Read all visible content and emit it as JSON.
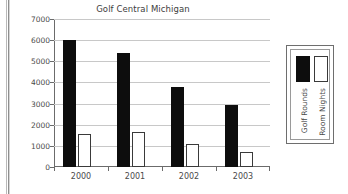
{
  "chart_data": {
    "type": "bar",
    "title": "Golf Central Michigan",
    "xlabel": "",
    "ylabel": "",
    "categories": [
      "2000",
      "2001",
      "2002",
      "2003"
    ],
    "series": [
      {
        "name": "Golf Rounds",
        "values": [
          6000,
          5400,
          3780,
          2930
        ],
        "color": "#0d0d0d",
        "fill": "solid-black"
      },
      {
        "name": "Room Nights",
        "values": [
          1550,
          1640,
          1100,
          730
        ],
        "color": "#ffffff",
        "fill": "white-outlined"
      }
    ],
    "ylim": [
      0,
      7000
    ],
    "yticks": [
      0,
      1000,
      2000,
      3000,
      4000,
      5000,
      6000,
      7000
    ],
    "ytick_labels": [
      "0",
      "1000",
      "2000",
      "3000",
      "4000",
      "5000",
      "6000",
      "7000"
    ],
    "grid": true,
    "grid_axis": "y",
    "legend": true,
    "legend_position": "right",
    "legend_orientation": "vertical-rotated-labels",
    "background": "#ffffff"
  }
}
